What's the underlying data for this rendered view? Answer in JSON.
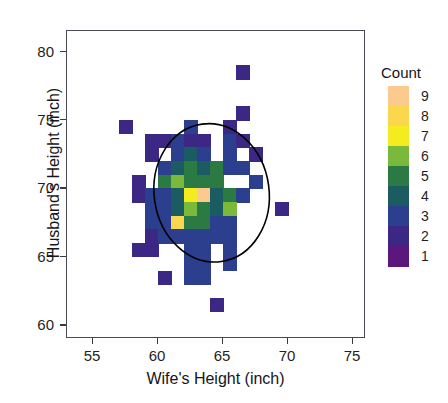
{
  "header": {
    "running_title": "",
    "page_number": ""
  },
  "figure": {
    "type": "heatmap",
    "axes": {
      "x": {
        "title": "Wife's Height (inch)",
        "ticks": [
          55,
          60,
          65,
          70,
          75
        ],
        "range": [
          53,
          76
        ]
      },
      "y": {
        "title": "Husband's Height (inch)",
        "ticks": [
          60,
          65,
          70,
          75,
          80
        ],
        "range": [
          59,
          81.5
        ]
      }
    },
    "legend": {
      "title": "Count",
      "labels": [
        9,
        8,
        7,
        6,
        5,
        4,
        3,
        2,
        1
      ],
      "colors": [
        "#fcc98f",
        "#fbd74f",
        "#f5ec1f",
        "#7bb93d",
        "#2c7a43",
        "#1b5b62",
        "#2b3f8e",
        "#3c2785",
        "#5b177c"
      ]
    },
    "overlay": {
      "shape": "ellipse",
      "stroke": "#000000",
      "center": [
        64.2,
        69.6
      ],
      "rx_inch": 4.45,
      "ry_inch": 5.1,
      "rotation_deg": -8
    }
  },
  "chart_data": {
    "type": "heatmap",
    "title": "",
    "xlabel": "Wife's Height (inch)",
    "ylabel": "Husband's Height (inch)",
    "xlim": [
      53,
      76
    ],
    "ylim": [
      59,
      81.5
    ],
    "grid": false,
    "legend_position": "right",
    "colorbar_label": "Count",
    "colorbar_ticks": [
      1,
      2,
      3,
      4,
      5,
      6,
      7,
      8,
      9
    ],
    "colorscale": [
      {
        "count": 1,
        "color": "#5b177c"
      },
      {
        "count": 2,
        "color": "#3c2785"
      },
      {
        "count": 3,
        "color": "#2b3f8e"
      },
      {
        "count": 4,
        "color": "#1b5b62"
      },
      {
        "count": 5,
        "color": "#2c7a43"
      },
      {
        "count": 6,
        "color": "#7bb93d"
      },
      {
        "count": 7,
        "color": "#f5ec1f"
      },
      {
        "count": 8,
        "color": "#fbd74f"
      },
      {
        "count": 9,
        "color": "#fcc98f"
      }
    ],
    "bin_width_x": 1.0,
    "bin_width_y": 1.0,
    "cells": [
      {
        "x": 66.5,
        "y": 78.5,
        "count": 2
      },
      {
        "x": 66.5,
        "y": 75.5,
        "count": 2
      },
      {
        "x": 57.5,
        "y": 74.5,
        "count": 2
      },
      {
        "x": 62.5,
        "y": 74.5,
        "count": 3
      },
      {
        "x": 65.5,
        "y": 74.5,
        "count": 2
      },
      {
        "x": 59.5,
        "y": 73.5,
        "count": 2
      },
      {
        "x": 60.5,
        "y": 73.5,
        "count": 2
      },
      {
        "x": 61.5,
        "y": 73.5,
        "count": 3
      },
      {
        "x": 62.5,
        "y": 73.5,
        "count": 2
      },
      {
        "x": 63.5,
        "y": 73.5,
        "count": 2
      },
      {
        "x": 65.5,
        "y": 73.5,
        "count": 3
      },
      {
        "x": 66.5,
        "y": 73.5,
        "count": 2
      },
      {
        "x": 59.5,
        "y": 72.5,
        "count": 2
      },
      {
        "x": 61.5,
        "y": 72.5,
        "count": 3
      },
      {
        "x": 62.5,
        "y": 72.5,
        "count": 4
      },
      {
        "x": 63.5,
        "y": 72.5,
        "count": 3
      },
      {
        "x": 65.5,
        "y": 72.5,
        "count": 3
      },
      {
        "x": 67.5,
        "y": 72.5,
        "count": 2
      },
      {
        "x": 60.5,
        "y": 71.5,
        "count": 3
      },
      {
        "x": 61.5,
        "y": 71.5,
        "count": 4
      },
      {
        "x": 62.5,
        "y": 71.5,
        "count": 5
      },
      {
        "x": 63.5,
        "y": 71.5,
        "count": 4
      },
      {
        "x": 64.5,
        "y": 71.5,
        "count": 5
      },
      {
        "x": 65.5,
        "y": 71.5,
        "count": 3
      },
      {
        "x": 66.5,
        "y": 71.5,
        "count": 3
      },
      {
        "x": 58.5,
        "y": 70.5,
        "count": 2
      },
      {
        "x": 60.5,
        "y": 70.5,
        "count": 5
      },
      {
        "x": 61.5,
        "y": 70.5,
        "count": 6
      },
      {
        "x": 62.5,
        "y": 70.5,
        "count": 5
      },
      {
        "x": 63.5,
        "y": 70.5,
        "count": 5
      },
      {
        "x": 64.5,
        "y": 70.5,
        "count": 5
      },
      {
        "x": 67.5,
        "y": 70.5,
        "count": 3
      },
      {
        "x": 58.5,
        "y": 69.5,
        "count": 2
      },
      {
        "x": 59.5,
        "y": 69.5,
        "count": 3
      },
      {
        "x": 60.5,
        "y": 69.5,
        "count": 3
      },
      {
        "x": 61.5,
        "y": 69.5,
        "count": 4
      },
      {
        "x": 62.5,
        "y": 69.5,
        "count": 7
      },
      {
        "x": 63.5,
        "y": 69.5,
        "count": 9
      },
      {
        "x": 64.5,
        "y": 69.5,
        "count": 4
      },
      {
        "x": 65.5,
        "y": 69.5,
        "count": 5
      },
      {
        "x": 66.5,
        "y": 69.5,
        "count": 3
      },
      {
        "x": 59.5,
        "y": 68.5,
        "count": 3
      },
      {
        "x": 60.5,
        "y": 68.5,
        "count": 3
      },
      {
        "x": 61.5,
        "y": 68.5,
        "count": 4
      },
      {
        "x": 62.5,
        "y": 68.5,
        "count": 6
      },
      {
        "x": 63.5,
        "y": 68.5,
        "count": 5
      },
      {
        "x": 64.5,
        "y": 68.5,
        "count": 4
      },
      {
        "x": 65.5,
        "y": 68.5,
        "count": 6
      },
      {
        "x": 69.5,
        "y": 68.5,
        "count": 2
      },
      {
        "x": 59.5,
        "y": 67.5,
        "count": 3
      },
      {
        "x": 60.5,
        "y": 67.5,
        "count": 3
      },
      {
        "x": 61.5,
        "y": 67.5,
        "count": 8
      },
      {
        "x": 62.5,
        "y": 67.5,
        "count": 5
      },
      {
        "x": 63.5,
        "y": 67.5,
        "count": 5
      },
      {
        "x": 64.5,
        "y": 67.5,
        "count": 3
      },
      {
        "x": 65.5,
        "y": 67.5,
        "count": 3
      },
      {
        "x": 59.5,
        "y": 66.5,
        "count": 2
      },
      {
        "x": 60.5,
        "y": 66.5,
        "count": 3
      },
      {
        "x": 61.5,
        "y": 66.5,
        "count": 3
      },
      {
        "x": 62.5,
        "y": 66.5,
        "count": 3
      },
      {
        "x": 63.5,
        "y": 66.5,
        "count": 3
      },
      {
        "x": 64.5,
        "y": 66.5,
        "count": 3
      },
      {
        "x": 65.5,
        "y": 66.5,
        "count": 3
      },
      {
        "x": 58.5,
        "y": 65.5,
        "count": 2
      },
      {
        "x": 59.5,
        "y": 65.5,
        "count": 2
      },
      {
        "x": 62.5,
        "y": 65.5,
        "count": 3
      },
      {
        "x": 63.5,
        "y": 65.5,
        "count": 3
      },
      {
        "x": 65.5,
        "y": 65.5,
        "count": 3
      },
      {
        "x": 62.5,
        "y": 64.5,
        "count": 3
      },
      {
        "x": 63.5,
        "y": 64.5,
        "count": 3
      },
      {
        "x": 65.5,
        "y": 64.5,
        "count": 3
      },
      {
        "x": 60.5,
        "y": 63.5,
        "count": 2
      },
      {
        "x": 62.5,
        "y": 63.5,
        "count": 3
      },
      {
        "x": 63.5,
        "y": 63.5,
        "count": 3
      },
      {
        "x": 64.5,
        "y": 61.5,
        "count": 2
      }
    ]
  }
}
